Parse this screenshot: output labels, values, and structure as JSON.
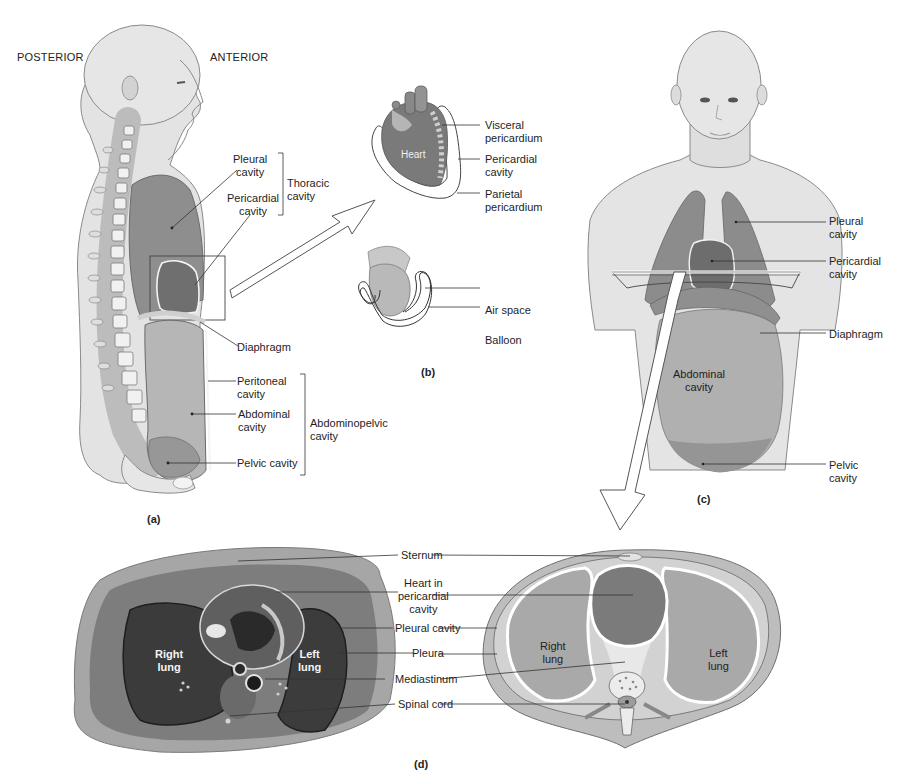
{
  "orientation": {
    "posterior": "POSTERIOR",
    "anterior": "ANTERIOR"
  },
  "panel_a": {
    "caption": "(a)",
    "labels": {
      "pleural_cavity": [
        "Pleural",
        "cavity"
      ],
      "pericardial_cavity": [
        "Pericardial",
        "cavity"
      ],
      "thoracic_cavity": [
        "Thoracic",
        "cavity"
      ],
      "diaphragm": "Diaphragm",
      "peritoneal_cavity": [
        "Peritoneal",
        "cavity"
      ],
      "abdominal_cavity": [
        "Abdominal",
        "cavity"
      ],
      "abdominopelvic_cavity": [
        "Abdominopelvic",
        "cavity"
      ],
      "pelvic_cavity": "Pelvic cavity"
    }
  },
  "panel_b": {
    "caption": "(b)",
    "labels": {
      "heart": "Heart",
      "visceral_pericardium": [
        "Visceral",
        "pericardium"
      ],
      "pericardial_cavity": [
        "Pericardial",
        "cavity"
      ],
      "parietal_pericardium": [
        "Parietal",
        "pericardium"
      ],
      "air_space": "Air space",
      "balloon": "Balloon"
    }
  },
  "panel_c": {
    "caption": "(c)",
    "labels": {
      "pleural_cavity": [
        "Pleural",
        "cavity"
      ],
      "pericardial_cavity": [
        "Pericardial",
        "cavity"
      ],
      "diaphragm": "Diaphragm",
      "abdominal_cavity": [
        "Abdominal",
        "cavity"
      ],
      "pelvic_cavity": [
        "Pelvic",
        "cavity"
      ]
    }
  },
  "panel_d": {
    "caption": "(d)",
    "labels": {
      "sternum": "Sternum",
      "heart_in_pericardial_cavity": [
        "Heart in",
        "pericardial",
        "cavity"
      ],
      "pleural_cavity": "Pleural cavity",
      "pleura": "Pleura",
      "mediastinum": "Mediastinum",
      "spinal_cord": "Spinal cord",
      "right_lung": [
        "Right",
        "lung"
      ],
      "left_lung": [
        "Left",
        "lung"
      ]
    }
  },
  "colors": {
    "background": "#ffffff",
    "skin": "#e2e2e2",
    "skin_shadow": "#c9c9c9",
    "thoracic_fill": "#8e8e8e",
    "heart_fill": "#6f6f6f",
    "abdominal_fill": "#b4b4b4",
    "pelvic_fill": "#9a9a9a",
    "photo_dark": "#3a3a3a",
    "line": "#333333"
  }
}
